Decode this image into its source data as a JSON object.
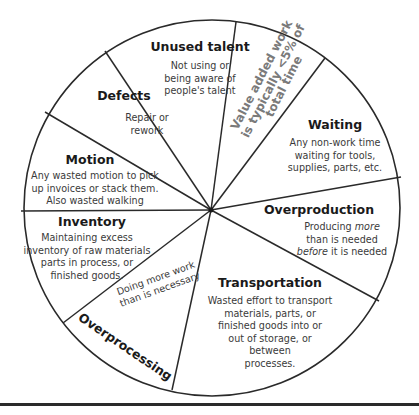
{
  "diagram": {
    "type": "wheel",
    "stroke_color": "#2a2a2a",
    "text_color": "#333333",
    "note_color": "#7a7a7a",
    "center": [
      211,
      210
    ],
    "radius": 189,
    "segments": [
      {
        "id": "unused-talent",
        "title": "Unused talent",
        "description": [
          "Not using or",
          "being aware of",
          "people's talent"
        ]
      },
      {
        "id": "value-added",
        "note": [
          "Value added work",
          "is typically <5% of",
          "total time"
        ]
      },
      {
        "id": "waiting",
        "title": "Waiting",
        "description": [
          "Any non-work time",
          "waiting for tools,",
          "supplies, parts, etc."
        ]
      },
      {
        "id": "overproduction",
        "title": "Overproduction",
        "description_parts": {
          "line1_pre": "Producing ",
          "line1_em": "more",
          "line2": "than is needed",
          "line3_em": "before",
          "line3_post": " it is needed"
        }
      },
      {
        "id": "transportation",
        "title": "Transportation",
        "description": [
          "Wasted effort to transport",
          "materials, parts, or",
          "finished goods into or",
          "out of storage, or",
          "between",
          "processes."
        ]
      },
      {
        "id": "overprocessing",
        "title": "Overprocessing",
        "description": [
          "Doing more work",
          "than is necessary"
        ]
      },
      {
        "id": "inventory",
        "title": "Inventory",
        "description": [
          "Maintaining excess",
          "inventory of raw materials",
          "parts in process, or",
          "finished goods."
        ]
      },
      {
        "id": "motion",
        "title": "Motion",
        "description": [
          "Any wasted motion to pick",
          "up invoices or stack them.",
          "Also wasted walking"
        ]
      },
      {
        "id": "defects",
        "title": "Defects",
        "description": [
          "Repair or",
          "rework"
        ]
      }
    ],
    "spoke_endpoints": [
      [
        105,
        51
      ],
      [
        236,
        22
      ],
      [
        325,
        58
      ],
      [
        402,
        177
      ],
      [
        379,
        301
      ],
      [
        172,
        390
      ],
      [
        63,
        323
      ],
      [
        21,
        211
      ],
      [
        45,
        112
      ]
    ]
  }
}
